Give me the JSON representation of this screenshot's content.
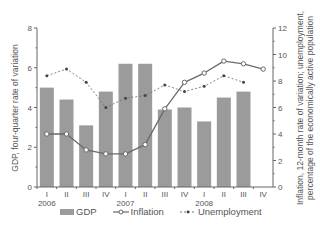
{
  "chart_data": {
    "type": "bar",
    "title": "",
    "categories": [
      "I",
      "II",
      "III",
      "IV",
      "I",
      "II",
      "III",
      "IV",
      "I",
      "II",
      "III",
      "IV"
    ],
    "years": [
      {
        "label": "2006",
        "index": 0
      },
      {
        "label": "2007",
        "index": 4
      },
      {
        "label": "2008",
        "index": 8
      }
    ],
    "series": [
      {
        "name": "GDP",
        "type": "bar",
        "axis": "left",
        "values": [
          5.0,
          4.4,
          3.1,
          4.8,
          6.2,
          6.2,
          3.9,
          4.0,
          3.3,
          4.5,
          4.8,
          null
        ]
      },
      {
        "name": "Inflation",
        "type": "line",
        "marker": "circle",
        "axis": "right",
        "values": [
          4.0,
          4.0,
          2.8,
          2.5,
          2.5,
          3.2,
          5.9,
          7.9,
          8.6,
          9.5,
          9.3,
          8.9
        ]
      },
      {
        "name": "Unemployment",
        "type": "line",
        "style": "dashed",
        "marker": "dot",
        "axis": "right",
        "values": [
          8.4,
          8.9,
          7.9,
          6.0,
          6.7,
          6.9,
          7.7,
          7.2,
          7.6,
          8.4,
          7.9,
          null
        ]
      }
    ],
    "ylabel": "GDP, four-quarter rate of variation",
    "y2label_line1": "Inflation, 12-month rate of variation; unemployment,",
    "y2label_line2": "percentage of the economically active population",
    "ylim": [
      0,
      8
    ],
    "y2lim": [
      0,
      12
    ],
    "yticks": [
      0,
      2,
      4,
      6,
      8
    ],
    "y2ticks": [
      0,
      2,
      4,
      6,
      8,
      10,
      12
    ],
    "grid": false,
    "legend_position": "bottom"
  },
  "legend": {
    "gdp": "GDP",
    "inflation": "Inflation",
    "unemployment": "Unemployment"
  },
  "colors": {
    "bar": "#9b9b9b",
    "inflation": "#6a6a6a",
    "unemployment": "#777777",
    "axis": "#666666"
  }
}
